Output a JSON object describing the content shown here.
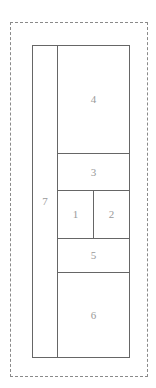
{
  "diagram": {
    "type": "nested-rectangle-partition",
    "colors": {
      "background": "#ffffff",
      "solid_stroke": "#666666",
      "dashed_stroke": "#8a8a8a",
      "label_text": "#9a9a9a"
    },
    "outer_frame": {
      "name": "page-boundary",
      "style": "dashed",
      "label": ""
    },
    "container": {
      "name": "layout-container",
      "style": "solid",
      "label": ""
    },
    "regions": [
      {
        "id": "7",
        "label": "7",
        "shape": "left-column",
        "position": "left-full-height"
      },
      {
        "id": "4",
        "label": "4",
        "shape": "large-block",
        "position": "top-right"
      },
      {
        "id": "3",
        "label": "3",
        "shape": "horizontal-band",
        "position": "upper-middle"
      },
      {
        "id": "1",
        "label": "1",
        "shape": "half-block",
        "position": "middle-left"
      },
      {
        "id": "2",
        "label": "2",
        "shape": "half-block",
        "position": "middle-right"
      },
      {
        "id": "5",
        "label": "5",
        "shape": "horizontal-band",
        "position": "lower-middle"
      },
      {
        "id": "6",
        "label": "6",
        "shape": "large-block",
        "position": "bottom-right"
      }
    ]
  }
}
